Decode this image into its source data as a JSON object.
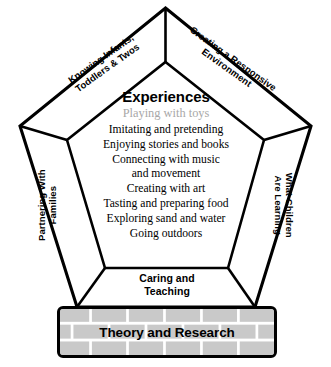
{
  "diagram": {
    "bands": [
      {
        "id": "knowing-infants",
        "label": "Knowing Infants,\nToddlers & Twos",
        "line1": "Knowing Infants,",
        "line2": "Toddlers & Twos",
        "position": "top-left",
        "rotation_deg": -35.5
      },
      {
        "id": "creating-responsive-environment",
        "label": "Creating a Responsive\nEnvironment",
        "line1": "Creating a Responsive",
        "line2": "Environment",
        "position": "top-right",
        "rotation_deg": 35.5
      },
      {
        "id": "partnering-with-families",
        "label": "Partnering With\nFamilies",
        "line1": "Partnering With",
        "line2": "Families",
        "position": "left",
        "rotation_deg": -90
      },
      {
        "id": "what-children-are-learning",
        "label": "What Children\nAre Learning",
        "line1": "What Children",
        "line2": "Are Learning",
        "position": "right",
        "rotation_deg": 90
      },
      {
        "id": "caring-and-teaching",
        "label": "Caring and\nTeaching",
        "line1": "Caring and",
        "line2": "Teaching",
        "position": "bottom",
        "rotation_deg": 0
      }
    ],
    "center": {
      "heading": "Experiences",
      "items": [
        {
          "text": "Playing with toys",
          "muted": true,
          "color": "#a8a8a8"
        },
        {
          "text": "Imitating and pretending",
          "muted": false
        },
        {
          "text": "Enjoying stories and books",
          "muted": false
        },
        {
          "text": "Connecting with music",
          "text_line2": "and movement",
          "muted": false
        },
        {
          "text": "Creating with art",
          "muted": false
        },
        {
          "text": "Tasting and preparing food",
          "muted": false
        },
        {
          "text": "Exploring sand and water",
          "muted": false
        },
        {
          "text": "Going outdoors",
          "muted": false
        }
      ]
    },
    "base": {
      "label": "Theory and Research",
      "pattern": "brick",
      "brick_color": "#c9c9c9",
      "mortar_color": "#ffffff",
      "border_color": "#000000"
    },
    "colors": {
      "outline": "#000000",
      "fill": "#ffffff",
      "muted_text": "#a8a8a8",
      "text": "#000000"
    }
  }
}
